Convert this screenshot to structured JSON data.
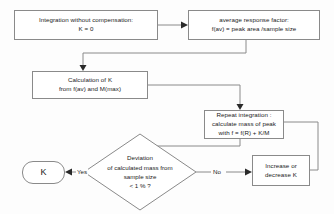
{
  "diagram": {
    "background_color": "#fdfdfd",
    "line_color": "#8a8a8a",
    "text_color": "#1b1b1b",
    "nodes": [
      {
        "id": "integration-without-compensation",
        "shape": "rectangle",
        "text": "Integration without compensation:\nK = 0"
      },
      {
        "id": "average-response-factor",
        "shape": "rectangle",
        "text": "average response factor:\nf(av) = peak area /sample size"
      },
      {
        "id": "calculation-of-k",
        "shape": "rectangle",
        "text": "Calculation of K\nfrom f(av) and M(max)"
      },
      {
        "id": "repeat-integration",
        "shape": "rectangle",
        "text": "Repeat integration :\ncalculate mass of peak\nwith   f = f(R) + K/M"
      },
      {
        "id": "deviation-decision",
        "shape": "diamond",
        "text": "Deviation\nof calculated mass from\nsample size\n< 1 % ?"
      },
      {
        "id": "increase-or-decrease-k",
        "shape": "rectangle",
        "text": "Increase or\ndecrease K"
      },
      {
        "id": "result-k",
        "shape": "terminal",
        "text": "K"
      }
    ],
    "edge_labels": {
      "yes": "Yes",
      "no": "No"
    }
  }
}
